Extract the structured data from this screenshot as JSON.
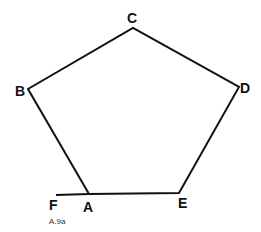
{
  "diagram": {
    "caption": "A.9a",
    "vertices": [
      {
        "label": "A",
        "x": 89,
        "y": 194
      },
      {
        "label": "B",
        "x": 28,
        "y": 89
      },
      {
        "label": "C",
        "x": 133,
        "y": 28
      },
      {
        "label": "D",
        "x": 239,
        "y": 87
      },
      {
        "label": "E",
        "x": 179,
        "y": 193
      }
    ],
    "extension": {
      "label": "F",
      "x": 56,
      "y": 195
    },
    "labels": {
      "A": "A",
      "B": "B",
      "C": "C",
      "D": "D",
      "E": "E",
      "F": "F"
    }
  }
}
